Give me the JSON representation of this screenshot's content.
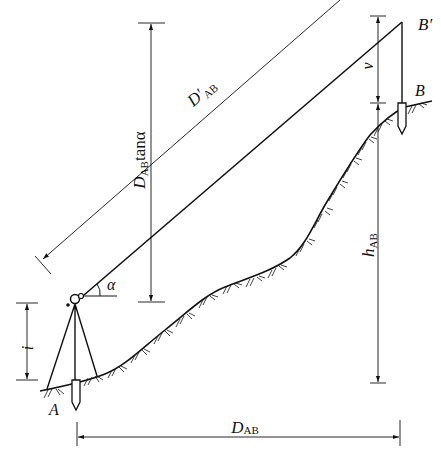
{
  "figure": {
    "type": "trigonometric-leveling-diagram",
    "colors": {
      "line": "#111111",
      "background": "#ffffff"
    }
  },
  "labels": {
    "point_a": "A",
    "point_b": "B",
    "point_b_prime": "B′",
    "angle": "α",
    "instrument_height": "i",
    "target_height": "v",
    "height_diff": {
      "main": "h",
      "sub": "AB"
    },
    "horizontal_distance": {
      "main": "D",
      "sub": "AB"
    },
    "slope_distance": {
      "main": "D′",
      "sub": "AB"
    },
    "vertical_component": {
      "main": "D",
      "sub": "AB",
      "tail": "tanα"
    }
  }
}
